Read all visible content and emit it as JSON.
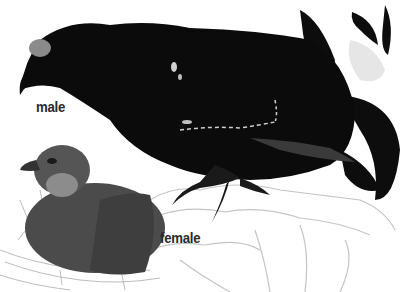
{
  "illustration": {
    "subject": "black grouse pair",
    "labels": {
      "male": "male",
      "female": "female"
    },
    "colors": {
      "background": "#ffffff",
      "male_plumage": "#0c0c0c",
      "male_comb": "#8a8a8a",
      "female_plumage": "#4a4a4a",
      "female_throat": "#8c8c8c",
      "rock_outline": "#bdbdbd",
      "label_text": "#2a2a2a"
    }
  }
}
